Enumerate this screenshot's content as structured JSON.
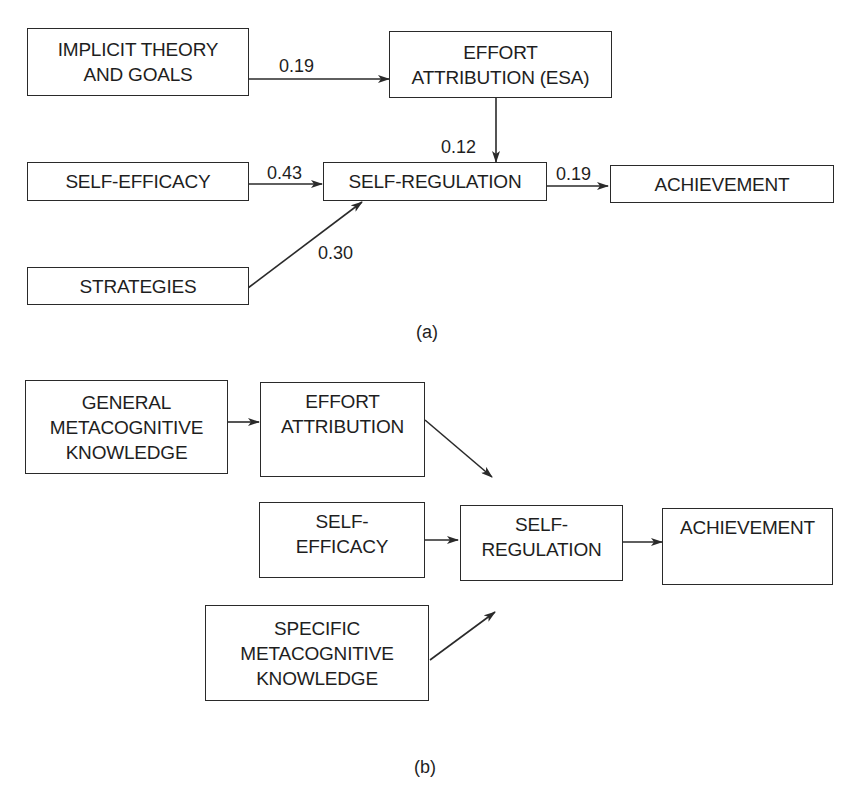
{
  "panel_a": {
    "label": "(a)",
    "nodes": {
      "implicit_theory": {
        "lines": [
          "IMPLICIT THEORY",
          "AND GOALS"
        ]
      },
      "effort_attribution": {
        "lines": [
          "EFFORT",
          "ATTRIBUTION (ESA)"
        ]
      },
      "self_efficacy": {
        "lines": [
          "SELF-EFFICACY"
        ]
      },
      "self_regulation": {
        "lines": [
          "SELF-REGULATION"
        ]
      },
      "achievement": {
        "lines": [
          "ACHIEVEMENT"
        ]
      },
      "strategies": {
        "lines": [
          "STRATEGIES"
        ]
      }
    },
    "paths": [
      {
        "from": "IMPLICIT THEORY AND GOALS",
        "to": "EFFORT ATTRIBUTION (ESA)",
        "coef": "0.19"
      },
      {
        "from": "EFFORT ATTRIBUTION (ESA)",
        "to": "SELF-REGULATION",
        "coef": "0.12"
      },
      {
        "from": "SELF-EFFICACY",
        "to": "SELF-REGULATION",
        "coef": "0.43"
      },
      {
        "from": "STRATEGIES",
        "to": "SELF-REGULATION",
        "coef": "0.30"
      },
      {
        "from": "SELF-REGULATION",
        "to": "ACHIEVEMENT",
        "coef": "0.19"
      }
    ]
  },
  "panel_b": {
    "label": "(b)",
    "nodes": {
      "general_metacognitive": {
        "lines": [
          "GENERAL",
          "METACOGNITIVE",
          "KNOWLEDGE"
        ]
      },
      "effort_attribution": {
        "lines": [
          "EFFORT",
          "ATTRIBUTION"
        ]
      },
      "self_efficacy": {
        "lines": [
          "SELF-",
          "EFFICACY"
        ]
      },
      "self_regulation": {
        "lines": [
          "SELF-",
          "REGULATION"
        ]
      },
      "achievement": {
        "lines": [
          "ACHIEVEMENT"
        ]
      },
      "specific_metacognitive": {
        "lines": [
          "SPECIFIC",
          "METACOGNITIVE",
          "KNOWLEDGE"
        ]
      }
    },
    "paths": [
      {
        "from": "GENERAL METACOGNITIVE KNOWLEDGE",
        "to": "EFFORT ATTRIBUTION"
      },
      {
        "from": "EFFORT ATTRIBUTION",
        "to": "SELF-REGULATION"
      },
      {
        "from": "SELF-EFFICACY",
        "to": "SELF-REGULATION"
      },
      {
        "from": "SPECIFIC METACOGNITIVE KNOWLEDGE",
        "to": "SELF-REGULATION"
      },
      {
        "from": "SELF-REGULATION",
        "to": "ACHIEVEMENT"
      }
    ]
  },
  "colors": {
    "line": "#2a2a2a",
    "text": "#1e1e1e",
    "background": "#ffffff"
  }
}
